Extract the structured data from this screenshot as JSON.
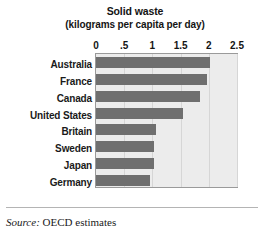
{
  "chart_data": {
    "type": "bar",
    "orientation": "horizontal",
    "title": "Solid waste",
    "subtitle": "(kilograms per capita per day)",
    "xlabel": "",
    "ylabel": "",
    "xlim": [
      0,
      2.5
    ],
    "grid": true,
    "legend": null,
    "tick_labels": [
      "0",
      ".5",
      "1",
      "1.5",
      "2",
      "2.5"
    ],
    "tick_values": [
      0,
      0.5,
      1,
      1.5,
      2,
      2.5
    ],
    "categories": [
      "Australia",
      "France",
      "Canada",
      "United States",
      "Britain",
      "Sweden",
      "Japan",
      "Germany"
    ],
    "values": [
      2.02,
      1.97,
      1.84,
      1.55,
      1.06,
      1.02,
      1.02,
      0.95
    ],
    "series": [
      {
        "name": "Solid waste",
        "values": [
          2.02,
          1.97,
          1.84,
          1.55,
          1.06,
          1.02,
          1.02,
          0.95
        ]
      }
    ],
    "colors": {
      "bar": "#6f6f6f",
      "plot_background": "#ececec",
      "gridline": "#d6d6d6",
      "plot_border": "#9a9a9a",
      "text": "#141414",
      "page_background": "#ffffff",
      "footer_rule": "#b4b4b4"
    }
  },
  "footer": {
    "source_label": "Source:",
    "source_text": " OECD estimates"
  }
}
